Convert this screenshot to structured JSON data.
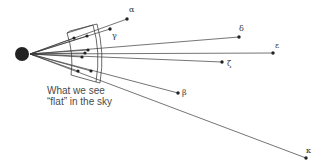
{
  "diagram": {
    "title": "",
    "caption": {
      "line1": "What we see",
      "line2": "“flat” in the sky"
    },
    "observer": {
      "name": "earth",
      "cx": 22,
      "cy": 54,
      "r": 7,
      "color": "#222222"
    },
    "origin": {
      "x": 30,
      "y": 54
    },
    "colors": {
      "line": "#3a3a3a",
      "star": "#222222",
      "panel": "#444444",
      "label": "#333333"
    },
    "stars": [
      {
        "label": "α",
        "x": 127,
        "y": 19,
        "lx": 129,
        "ly": 12
      },
      {
        "label": "γ",
        "x": 110,
        "y": 29,
        "lx": 112,
        "ly": 38
      },
      {
        "label": "δ",
        "x": 239,
        "y": 37,
        "lx": 239,
        "ly": 31
      },
      {
        "label": "ε",
        "x": 273,
        "y": 53,
        "lx": 275,
        "ly": 48
      },
      {
        "label": "ζ",
        "x": 222,
        "y": 62,
        "lx": 227,
        "ly": 66
      },
      {
        "label": "β",
        "x": 178,
        "y": 93,
        "lx": 182,
        "ly": 95
      },
      {
        "label": "κ",
        "x": 306,
        "y": 158,
        "lx": 306,
        "ly": 153
      }
    ],
    "projections": [
      {
        "x": 74,
        "y": 38
      },
      {
        "x": 87,
        "y": 36
      },
      {
        "x": 88,
        "y": 50
      },
      {
        "x": 85,
        "y": 53
      },
      {
        "x": 82,
        "y": 57
      },
      {
        "x": 78,
        "y": 71
      },
      {
        "x": 91,
        "y": 71
      }
    ]
  }
}
